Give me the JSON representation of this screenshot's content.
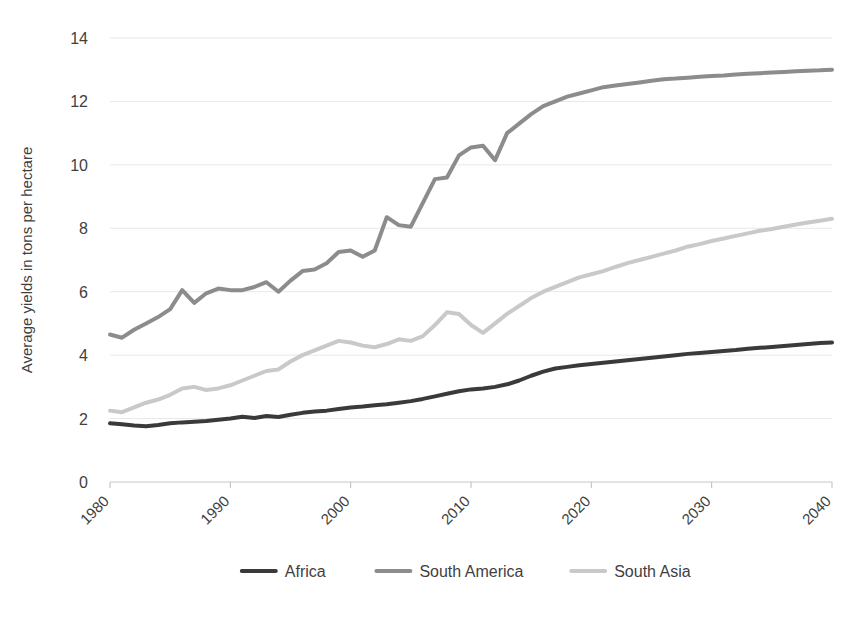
{
  "chart_data": {
    "type": "line",
    "title": "",
    "xlabel": "",
    "ylabel": "Average yields in tons per hectare",
    "xlim": [
      1980,
      2040
    ],
    "ylim": [
      0,
      14
    ],
    "ytick_values": [
      0,
      2,
      4,
      6,
      8,
      10,
      12,
      14
    ],
    "ytick_labels": [
      "0",
      "2",
      "4",
      "6",
      "8",
      "10",
      "12",
      "14"
    ],
    "xtick_values": [
      1980,
      1990,
      2000,
      2010,
      2020,
      2030,
      2040
    ],
    "xtick_labels": [
      "1980",
      "1990",
      "2000",
      "2010",
      "2020",
      "2030",
      "2040"
    ],
    "grid": true,
    "legend_position": "bottom",
    "x": [
      1980,
      1981,
      1982,
      1983,
      1984,
      1985,
      1986,
      1987,
      1988,
      1989,
      1990,
      1991,
      1992,
      1993,
      1994,
      1995,
      1996,
      1997,
      1998,
      1999,
      2000,
      2001,
      2002,
      2003,
      2004,
      2005,
      2006,
      2007,
      2008,
      2009,
      2010,
      2011,
      2012,
      2013,
      2014,
      2015,
      2016,
      2017,
      2018,
      2019,
      2020,
      2021,
      2022,
      2023,
      2024,
      2025,
      2026,
      2027,
      2028,
      2029,
      2030,
      2031,
      2032,
      2033,
      2034,
      2035,
      2036,
      2037,
      2038,
      2039,
      2040
    ],
    "series": [
      {
        "name": "Africa",
        "color": "#3a3a3a",
        "width": 4.0,
        "values": [
          1.85,
          1.82,
          1.78,
          1.76,
          1.8,
          1.85,
          1.88,
          1.9,
          1.92,
          1.96,
          2.0,
          2.06,
          2.02,
          2.08,
          2.05,
          2.12,
          2.18,
          2.22,
          2.25,
          2.3,
          2.35,
          2.38,
          2.42,
          2.45,
          2.5,
          2.55,
          2.62,
          2.7,
          2.78,
          2.86,
          2.92,
          2.95,
          3.0,
          3.08,
          3.2,
          3.35,
          3.48,
          3.58,
          3.63,
          3.68,
          3.72,
          3.76,
          3.8,
          3.84,
          3.88,
          3.92,
          3.96,
          4.0,
          4.04,
          4.07,
          4.1,
          4.13,
          4.16,
          4.2,
          4.23,
          4.26,
          4.29,
          4.32,
          4.35,
          4.38,
          4.4
        ]
      },
      {
        "name": "South America",
        "color": "#8c8c8c",
        "width": 4.0,
        "values": [
          4.65,
          4.55,
          4.8,
          5.0,
          5.2,
          5.45,
          6.05,
          5.65,
          5.95,
          6.1,
          6.05,
          6.05,
          6.15,
          6.3,
          6.0,
          6.35,
          6.65,
          6.7,
          6.9,
          7.25,
          7.3,
          7.1,
          7.3,
          8.35,
          8.1,
          8.05,
          8.8,
          9.55,
          9.6,
          10.3,
          10.55,
          10.6,
          10.15,
          11.0,
          11.3,
          11.6,
          11.85,
          12.0,
          12.15,
          12.25,
          12.35,
          12.45,
          12.5,
          12.55,
          12.6,
          12.65,
          12.7,
          12.72,
          12.75,
          12.78,
          12.8,
          12.82,
          12.85,
          12.87,
          12.89,
          12.91,
          12.93,
          12.95,
          12.97,
          12.98,
          13.0
        ]
      },
      {
        "name": "South Asia",
        "color": "#c9c9c9",
        "width": 4.0,
        "values": [
          2.25,
          2.2,
          2.35,
          2.5,
          2.6,
          2.75,
          2.95,
          3.0,
          2.9,
          2.95,
          3.05,
          3.2,
          3.35,
          3.5,
          3.55,
          3.8,
          4.0,
          4.15,
          4.3,
          4.45,
          4.4,
          4.3,
          4.25,
          4.35,
          4.5,
          4.45,
          4.6,
          4.95,
          5.35,
          5.3,
          4.95,
          4.7,
          5.0,
          5.3,
          5.55,
          5.8,
          6.0,
          6.15,
          6.3,
          6.45,
          6.55,
          6.65,
          6.78,
          6.9,
          7.0,
          7.1,
          7.2,
          7.3,
          7.42,
          7.5,
          7.6,
          7.68,
          7.76,
          7.84,
          7.92,
          7.98,
          8.05,
          8.12,
          8.18,
          8.24,
          8.3
        ]
      }
    ],
    "legend": [
      {
        "label": "Africa",
        "color": "#3a3a3a"
      },
      {
        "label": "South America",
        "color": "#8c8c8c"
      },
      {
        "label": "South Asia",
        "color": "#c9c9c9"
      }
    ]
  },
  "colors": {
    "background": "#ffffff",
    "text": "#3f3f3f",
    "grid": "#e8e8e8",
    "axis": "#d4d4d4"
  }
}
